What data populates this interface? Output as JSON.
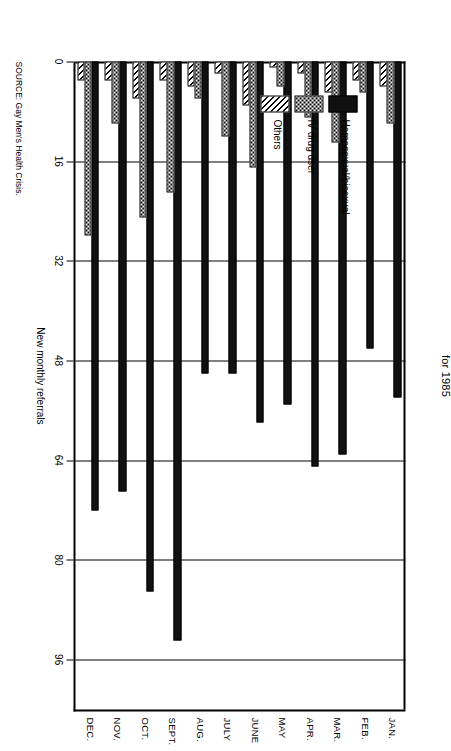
{
  "chart_data": {
    "type": "bar",
    "orientation": "horizontal-stacked-grouped",
    "title": "for 1985",
    "xlabel": "",
    "ylabel": "New monthly referrals",
    "value_axis_caption": "New monthly referrals",
    "ylim": [
      0,
      104
    ],
    "ticks": [
      0,
      16,
      32,
      48,
      64,
      80,
      96
    ],
    "tick_labels": [
      "0",
      "16",
      "32",
      "48",
      "64",
      "80",
      "96"
    ],
    "grid": true,
    "legend_position": "upper-left-inside",
    "categories": [
      "JAN.",
      "FEB.",
      "MAR.",
      "APR.",
      "MAY",
      "JUNE",
      "JULY",
      "AUG.",
      "SEPT.",
      "OCT.",
      "NOV.",
      "DEC."
    ],
    "series": [
      {
        "name": "Homosexual/bisexual",
        "pattern": "solid-black",
        "values": [
          54,
          46,
          63,
          65,
          55,
          58,
          50,
          50,
          93,
          85,
          69,
          72
        ]
      },
      {
        "name": "IV drug user",
        "pattern": "dotted",
        "values": [
          10,
          5,
          13,
          9,
          4,
          17,
          12,
          6,
          21,
          25,
          10,
          28
        ]
      },
      {
        "name": "Others",
        "pattern": "diagonal-hatch",
        "values": [
          4,
          3,
          5,
          2,
          1,
          7,
          2,
          4,
          3,
          6,
          3,
          3
        ]
      }
    ],
    "source": "SOURCE: Gay Men's Health Crisis."
  },
  "legend": {
    "items": [
      {
        "label": "Homosexual/bisexual",
        "swatch": "solid-black"
      },
      {
        "label": "IV drug user",
        "swatch": "dotted"
      },
      {
        "label": "Others",
        "swatch": "diagonal-hatch"
      }
    ]
  }
}
